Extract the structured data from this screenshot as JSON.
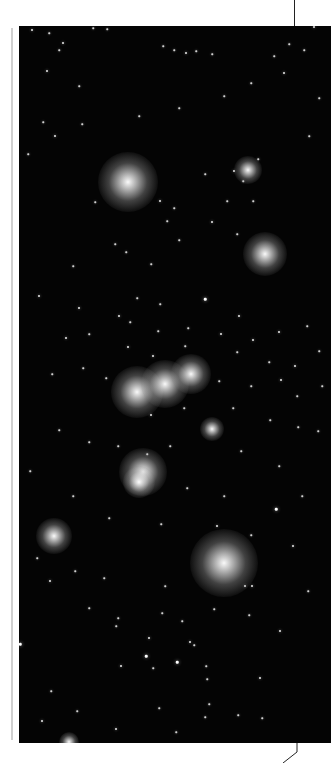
{
  "photo": {
    "subject": "star field",
    "background": "#040404",
    "bright_stars": [
      {
        "x": 109,
        "y": 156,
        "r": 30
      },
      {
        "x": 246,
        "y": 228,
        "r": 22
      },
      {
        "x": 118,
        "y": 366,
        "r": 26
      },
      {
        "x": 146,
        "y": 358,
        "r": 24
      },
      {
        "x": 172,
        "y": 348,
        "r": 20
      },
      {
        "x": 124,
        "y": 446,
        "r": 24
      },
      {
        "x": 120,
        "y": 456,
        "r": 16
      },
      {
        "x": 205,
        "y": 537,
        "r": 34
      },
      {
        "x": 35,
        "y": 510,
        "r": 18
      },
      {
        "x": 229,
        "y": 144,
        "r": 14
      },
      {
        "x": 193,
        "y": 403,
        "r": 12
      },
      {
        "x": 50,
        "y": 716,
        "r": 10
      }
    ],
    "stars": [
      {
        "x": 13,
        "y": 4,
        "s": 2
      },
      {
        "x": 30,
        "y": 7,
        "s": 1.5
      },
      {
        "x": 74,
        "y": 2,
        "s": 1.5
      },
      {
        "x": 88,
        "y": 3,
        "s": 1.5
      },
      {
        "x": 44,
        "y": 17,
        "s": 2
      },
      {
        "x": 40,
        "y": 24,
        "s": 1.5
      },
      {
        "x": 144,
        "y": 20,
        "s": 1.5
      },
      {
        "x": 155,
        "y": 24,
        "s": 1.5
      },
      {
        "x": 167,
        "y": 27,
        "s": 2
      },
      {
        "x": 177,
        "y": 25,
        "s": 1.5
      },
      {
        "x": 193,
        "y": 28,
        "s": 1.5
      },
      {
        "x": 295,
        "y": 1,
        "s": 2
      },
      {
        "x": 285,
        "y": 24,
        "s": 1.5
      },
      {
        "x": 270,
        "y": 18,
        "s": 1.5
      },
      {
        "x": 255,
        "y": 30,
        "s": 1.5
      },
      {
        "x": 28,
        "y": 45,
        "s": 2
      },
      {
        "x": 60,
        "y": 60,
        "s": 1.5
      },
      {
        "x": 24,
        "y": 96,
        "s": 1.5
      },
      {
        "x": 36,
        "y": 110,
        "s": 2
      },
      {
        "x": 9,
        "y": 128,
        "s": 1.5
      },
      {
        "x": 63,
        "y": 98,
        "s": 1.5
      },
      {
        "x": 120,
        "y": 90,
        "s": 1.5
      },
      {
        "x": 160,
        "y": 82,
        "s": 1.5
      },
      {
        "x": 205,
        "y": 70,
        "s": 1.5
      },
      {
        "x": 232,
        "y": 57,
        "s": 1.5
      },
      {
        "x": 265,
        "y": 47,
        "s": 2
      },
      {
        "x": 300,
        "y": 72,
        "s": 1.5
      },
      {
        "x": 290,
        "y": 110,
        "s": 1.5
      },
      {
        "x": 76,
        "y": 176,
        "s": 1.5
      },
      {
        "x": 141,
        "y": 175,
        "s": 2
      },
      {
        "x": 148,
        "y": 195,
        "s": 1.5
      },
      {
        "x": 155,
        "y": 182,
        "s": 1.5
      },
      {
        "x": 186,
        "y": 148,
        "s": 1.5
      },
      {
        "x": 215,
        "y": 145,
        "s": 2
      },
      {
        "x": 224,
        "y": 155,
        "s": 1.5
      },
      {
        "x": 239,
        "y": 133,
        "s": 1.5
      },
      {
        "x": 193,
        "y": 196,
        "s": 2
      },
      {
        "x": 208,
        "y": 175,
        "s": 1.5
      },
      {
        "x": 234,
        "y": 175,
        "s": 1.5
      },
      {
        "x": 218,
        "y": 208,
        "s": 1.5
      },
      {
        "x": 107,
        "y": 226,
        "s": 1.5
      },
      {
        "x": 96,
        "y": 218,
        "s": 1.5
      },
      {
        "x": 160,
        "y": 214,
        "s": 1.5
      },
      {
        "x": 132,
        "y": 238,
        "s": 1.5
      },
      {
        "x": 54,
        "y": 240,
        "s": 1.5
      },
      {
        "x": 20,
        "y": 270,
        "s": 2
      },
      {
        "x": 60,
        "y": 282,
        "s": 2
      },
      {
        "x": 100,
        "y": 290,
        "s": 2
      },
      {
        "x": 186,
        "y": 273,
        "s": 2.5
      },
      {
        "x": 220,
        "y": 290,
        "s": 2
      },
      {
        "x": 118,
        "y": 272,
        "s": 1.5
      },
      {
        "x": 141,
        "y": 278,
        "s": 1.5
      },
      {
        "x": 47,
        "y": 312,
        "s": 2
      },
      {
        "x": 70,
        "y": 308,
        "s": 1.5
      },
      {
        "x": 111,
        "y": 296,
        "s": 1.5
      },
      {
        "x": 139,
        "y": 305,
        "s": 1.5
      },
      {
        "x": 169,
        "y": 302,
        "s": 1.5
      },
      {
        "x": 202,
        "y": 308,
        "s": 2
      },
      {
        "x": 234,
        "y": 314,
        "s": 2
      },
      {
        "x": 260,
        "y": 306,
        "s": 2
      },
      {
        "x": 288,
        "y": 300,
        "s": 1.5
      },
      {
        "x": 109,
        "y": 321,
        "s": 2
      },
      {
        "x": 134,
        "y": 330,
        "s": 2
      },
      {
        "x": 166,
        "y": 320,
        "s": 1.5
      },
      {
        "x": 218,
        "y": 326,
        "s": 1.5
      },
      {
        "x": 250,
        "y": 336,
        "s": 1.5
      },
      {
        "x": 276,
        "y": 340,
        "s": 2
      },
      {
        "x": 300,
        "y": 325,
        "s": 1.5
      },
      {
        "x": 33,
        "y": 348,
        "s": 1.5
      },
      {
        "x": 64,
        "y": 342,
        "s": 1.5
      },
      {
        "x": 87,
        "y": 352,
        "s": 1.5
      },
      {
        "x": 200,
        "y": 355,
        "s": 1.5
      },
      {
        "x": 232,
        "y": 360,
        "s": 1.5
      },
      {
        "x": 262,
        "y": 354,
        "s": 2
      },
      {
        "x": 278,
        "y": 370,
        "s": 1.5
      },
      {
        "x": 303,
        "y": 360,
        "s": 1.5
      },
      {
        "x": 132,
        "y": 389,
        "s": 2
      },
      {
        "x": 165,
        "y": 382,
        "s": 1.5
      },
      {
        "x": 214,
        "y": 382,
        "s": 1.5
      },
      {
        "x": 251,
        "y": 394,
        "s": 1.5
      },
      {
        "x": 279,
        "y": 401,
        "s": 1.5
      },
      {
        "x": 299,
        "y": 405,
        "s": 1.5
      },
      {
        "x": 40,
        "y": 404,
        "s": 1.5
      },
      {
        "x": 70,
        "y": 416,
        "s": 1.5
      },
      {
        "x": 99,
        "y": 420,
        "s": 1.5
      },
      {
        "x": 128,
        "y": 428,
        "s": 1.5
      },
      {
        "x": 151,
        "y": 420,
        "s": 1.5
      },
      {
        "x": 222,
        "y": 425,
        "s": 1.5
      },
      {
        "x": 260,
        "y": 440,
        "s": 1.5
      },
      {
        "x": 11,
        "y": 445,
        "s": 1.5
      },
      {
        "x": 54,
        "y": 470,
        "s": 1.5
      },
      {
        "x": 168,
        "y": 462,
        "s": 1.5
      },
      {
        "x": 205,
        "y": 470,
        "s": 1.5
      },
      {
        "x": 257,
        "y": 483,
        "s": 2.5
      },
      {
        "x": 283,
        "y": 470,
        "s": 1.5
      },
      {
        "x": 90,
        "y": 492,
        "s": 1.5
      },
      {
        "x": 142,
        "y": 498,
        "s": 1.5
      },
      {
        "x": 198,
        "y": 500,
        "s": 2
      },
      {
        "x": 232,
        "y": 509,
        "s": 1.5
      },
      {
        "x": 274,
        "y": 520,
        "s": 2
      },
      {
        "x": 18,
        "y": 532,
        "s": 1.5
      },
      {
        "x": 31,
        "y": 555,
        "s": 2
      },
      {
        "x": 56,
        "y": 545,
        "s": 1.5
      },
      {
        "x": 85,
        "y": 552,
        "s": 1.5
      },
      {
        "x": 146,
        "y": 560,
        "s": 1.5
      },
      {
        "x": 226,
        "y": 560,
        "s": 2
      },
      {
        "x": 233,
        "y": 560,
        "s": 2
      },
      {
        "x": 289,
        "y": 565,
        "s": 1.5
      },
      {
        "x": 97,
        "y": 600,
        "s": 1.5
      },
      {
        "x": 70,
        "y": 582,
        "s": 1.5
      },
      {
        "x": 195,
        "y": 583,
        "s": 1.5
      },
      {
        "x": 1,
        "y": 618,
        "s": 2.5
      },
      {
        "x": 99,
        "y": 592,
        "s": 1.5
      },
      {
        "x": 130,
        "y": 612,
        "s": 2
      },
      {
        "x": 127,
        "y": 630,
        "s": 2.5
      },
      {
        "x": 102,
        "y": 640,
        "s": 2
      },
      {
        "x": 134,
        "y": 642,
        "s": 1.5
      },
      {
        "x": 158,
        "y": 636,
        "s": 2.5
      },
      {
        "x": 171,
        "y": 616,
        "s": 2
      },
      {
        "x": 175,
        "y": 619,
        "s": 1.5
      },
      {
        "x": 187,
        "y": 640,
        "s": 1.5
      },
      {
        "x": 188,
        "y": 653,
        "s": 1.5
      },
      {
        "x": 241,
        "y": 652,
        "s": 2
      },
      {
        "x": 261,
        "y": 605,
        "s": 2
      },
      {
        "x": 230,
        "y": 589,
        "s": 1.5
      },
      {
        "x": 143,
        "y": 587,
        "s": 1.5
      },
      {
        "x": 163,
        "y": 595,
        "s": 1.5
      },
      {
        "x": 32,
        "y": 665,
        "s": 1.5
      },
      {
        "x": 58,
        "y": 685,
        "s": 1.5
      },
      {
        "x": 140,
        "y": 682,
        "s": 1.5
      },
      {
        "x": 190,
        "y": 678,
        "s": 1.5
      },
      {
        "x": 23,
        "y": 695,
        "s": 2
      },
      {
        "x": 97,
        "y": 703,
        "s": 2
      },
      {
        "x": 157,
        "y": 706,
        "s": 1.5
      },
      {
        "x": 186,
        "y": 691,
        "s": 1.5
      },
      {
        "x": 219,
        "y": 689,
        "s": 1.5
      },
      {
        "x": 243,
        "y": 692,
        "s": 1.5
      }
    ]
  },
  "decor": {
    "margin_rule_color": "#cfcfcf",
    "leader_line_color": "#222222"
  }
}
